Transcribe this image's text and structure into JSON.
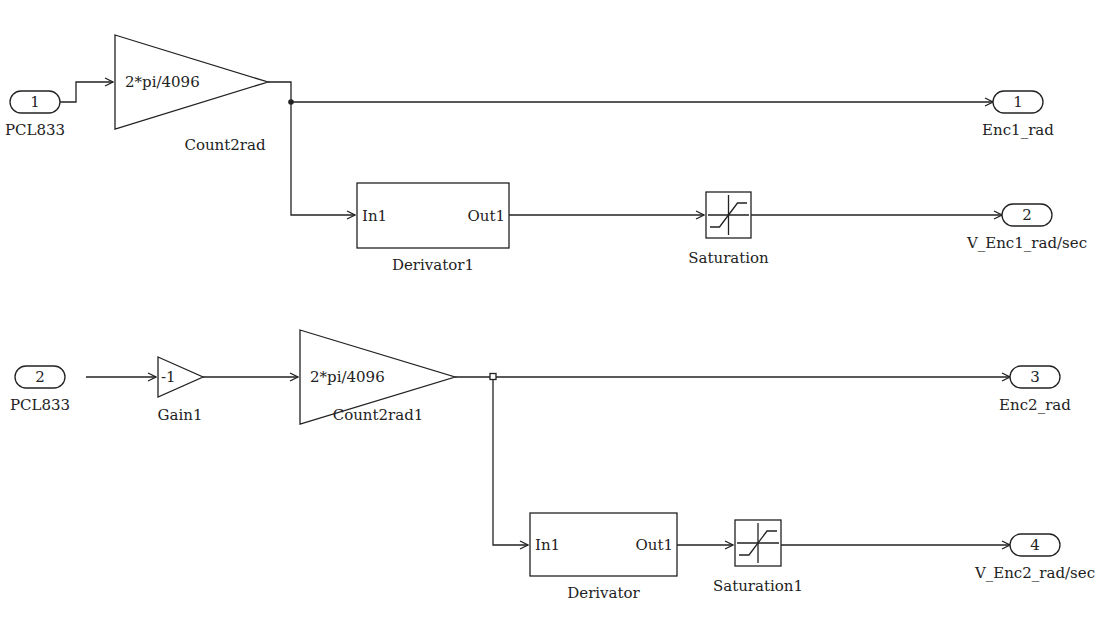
{
  "diagram": {
    "inports": [
      {
        "id": "in1",
        "number": "1",
        "label": "PCL833",
        "x": 35,
        "y": 102
      },
      {
        "id": "in2",
        "number": "2",
        "label": "PCL833",
        "x": 40,
        "y": 377
      }
    ],
    "gains": [
      {
        "id": "count2rad",
        "value": "2*pi/4096",
        "label": "Count2rad",
        "x1": 115,
        "y1": 35,
        "x2": 268,
        "ytip": 82,
        "y3": 129,
        "lx": 225,
        "ly": 150
      },
      {
        "id": "gain1",
        "value": "-1",
        "label": "Gain1",
        "x1": 158,
        "y1": 357,
        "x2": 203,
        "ytip": 377,
        "y3": 397,
        "lx": 180,
        "ly": 420
      },
      {
        "id": "count2rad1",
        "value": "2*pi/4096",
        "label": "Count2rad1",
        "x1": 300,
        "y1": 330,
        "x2": 455,
        "ytip": 377,
        "y3": 424,
        "lx": 378,
        "ly": 420
      }
    ],
    "derivators": [
      {
        "id": "derivator1",
        "in_label": "In1",
        "out_label": "Out1",
        "label": "Derivator1",
        "x": 357,
        "y": 183,
        "w": 152,
        "h": 65
      },
      {
        "id": "derivator",
        "in_label": "In1",
        "out_label": "Out1",
        "label": "Derivator",
        "x": 530,
        "y": 513,
        "w": 147,
        "h": 63
      }
    ],
    "saturations": [
      {
        "id": "saturation",
        "label": "Saturation",
        "x": 706,
        "y": 192,
        "w": 45,
        "h": 46
      },
      {
        "id": "saturation1",
        "label": "Saturation1",
        "x": 735,
        "y": 520,
        "w": 46,
        "h": 46
      }
    ],
    "outports": [
      {
        "id": "out1",
        "number": "1",
        "label": "Enc1_rad",
        "x": 1018,
        "y": 102
      },
      {
        "id": "out2",
        "number": "2",
        "label": "V_Enc1_rad/sec",
        "x": 1027,
        "y": 215
      },
      {
        "id": "out3",
        "number": "3",
        "label": "Enc2_rad",
        "x": 1035,
        "y": 377
      },
      {
        "id": "out4",
        "number": "4",
        "label": "V_Enc2_rad/sec",
        "x": 1035,
        "y": 545
      }
    ]
  }
}
